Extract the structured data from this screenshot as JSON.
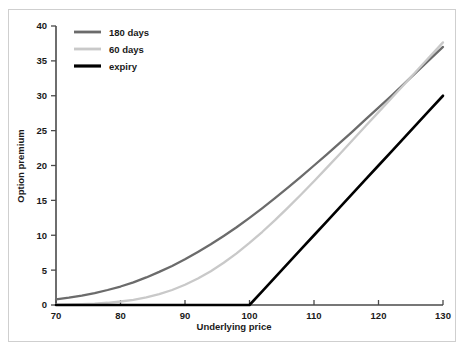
{
  "figure": {
    "background_color": "#ffffff",
    "frame_color": "#cfcfcf",
    "axis_color": "#4a4a4a"
  },
  "axes": {
    "x_title": "Underlying price",
    "y_title": "Option premium",
    "x_ticks": [
      "70",
      "80",
      "90",
      "100",
      "110",
      "120",
      "130"
    ],
    "y_ticks": [
      "0",
      "5",
      "10",
      "15",
      "20",
      "25",
      "30",
      "35",
      "40"
    ]
  },
  "legend": {
    "position": "top-left-inside",
    "items": [
      {
        "label": "180 days",
        "color": "#6b6b6b"
      },
      {
        "label": "60 days",
        "color": "#c9c9c9"
      },
      {
        "label": "expiry",
        "color": "#000000"
      }
    ]
  },
  "chart_data": {
    "type": "line",
    "title": "",
    "subtitle": "",
    "xlabel": "Underlying price",
    "ylabel": "Option premium",
    "xlim": [
      70,
      130
    ],
    "ylim": [
      0,
      40
    ],
    "xticks": [
      70,
      80,
      90,
      100,
      110,
      120,
      130
    ],
    "yticks": [
      0,
      5,
      10,
      15,
      20,
      25,
      30,
      35,
      40
    ],
    "grid": false,
    "legend_position": "upper left",
    "annotations": [],
    "strike": 100,
    "x": [
      70,
      72,
      74,
      76,
      78,
      80,
      82,
      84,
      86,
      88,
      90,
      92,
      94,
      96,
      98,
      100,
      102,
      104,
      106,
      108,
      110,
      112,
      114,
      116,
      118,
      120,
      122,
      124,
      126,
      128,
      130
    ],
    "series": [
      {
        "name": "180 days",
        "color": "#6b6b6b",
        "width": 2.3,
        "values": [
          0.8,
          1.05,
          1.35,
          1.7,
          2.15,
          2.65,
          3.25,
          3.95,
          4.75,
          5.6,
          6.55,
          7.6,
          8.7,
          9.9,
          11.15,
          12.5,
          13.9,
          15.35,
          16.85,
          18.4,
          20.0,
          21.6,
          23.25,
          24.9,
          26.6,
          28.3,
          30.0,
          31.75,
          33.5,
          35.25,
          37.0
        ]
      },
      {
        "name": "60 days",
        "color": "#c9c9c9",
        "width": 2.3,
        "values": [
          0.05,
          0.08,
          0.13,
          0.2,
          0.32,
          0.5,
          0.75,
          1.1,
          1.55,
          2.15,
          2.9,
          3.8,
          4.85,
          6.05,
          7.4,
          8.9,
          10.5,
          12.2,
          14.0,
          15.85,
          17.75,
          19.7,
          21.65,
          23.65,
          25.65,
          27.65,
          29.65,
          31.65,
          33.65,
          35.65,
          37.65
        ]
      },
      {
        "name": "expiry",
        "color": "#000000",
        "width": 2.6,
        "values": [
          0,
          0,
          0,
          0,
          0,
          0,
          0,
          0,
          0,
          0,
          0,
          0,
          0,
          0,
          0,
          0,
          2,
          4,
          6,
          8,
          10,
          12,
          14,
          16,
          18,
          20,
          22,
          24,
          26,
          28,
          30
        ]
      }
    ]
  }
}
